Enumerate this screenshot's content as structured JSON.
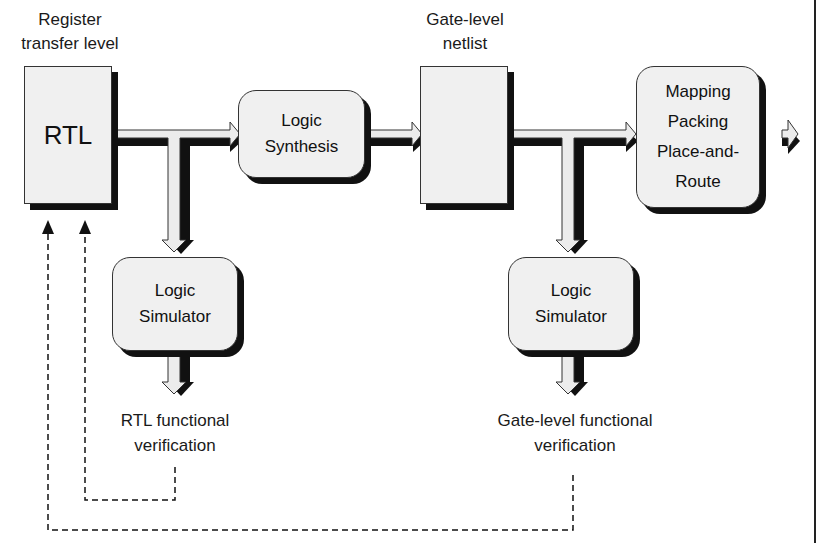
{
  "diagram": {
    "top_labels": {
      "rtl": [
        "Register",
        "transfer level"
      ],
      "netlist": [
        "Gate-level",
        "netlist"
      ]
    },
    "boxes": {
      "rtl": "RTL",
      "synthesis": [
        "Logic",
        "Synthesis"
      ],
      "netlist": "",
      "mapping": [
        "Mapping",
        "Packing",
        "Place-and-",
        "Route"
      ],
      "sim1": [
        "Logic",
        "Simulator"
      ],
      "sim2": [
        "Logic",
        "Simulator"
      ]
    },
    "outputs": {
      "rtl_verif": [
        "RTL functional",
        "verification"
      ],
      "gate_verif": [
        "Gate-level functional",
        "verification"
      ]
    },
    "colors": {
      "box_fill": "#f0f0f0",
      "shadow": "#111111",
      "line": "#222222"
    }
  }
}
